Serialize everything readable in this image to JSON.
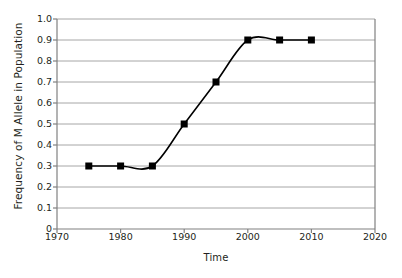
{
  "chart_data": {
    "type": "line",
    "title": "",
    "xlabel": "Time",
    "ylabel": "Frequency of M Allele in Population",
    "x": [
      1975,
      1980,
      1985,
      1990,
      1995,
      2000,
      2005,
      2010
    ],
    "values": [
      0.3,
      0.3,
      0.3,
      0.5,
      0.7,
      0.9,
      0.9,
      0.9
    ],
    "series": [
      {
        "name": "M allele frequency",
        "values": [
          0.3,
          0.3,
          0.3,
          0.5,
          0.7,
          0.9,
          0.9,
          0.9
        ]
      }
    ],
    "xlim": [
      1970,
      2020
    ],
    "ylim": [
      0,
      1.0
    ],
    "xticks": [
      1970,
      1980,
      1990,
      2000,
      2010,
      2020
    ],
    "xtick_labels": [
      "1970",
      "1980",
      "1990",
      "2000",
      "2010",
      "2020"
    ],
    "yticks": [
      0,
      0.1,
      0.2,
      0.3,
      0.4,
      0.5,
      0.6,
      0.7,
      0.8,
      0.9,
      1.0
    ],
    "ytick_labels": [
      "0",
      "0.1",
      "0.2",
      "0.3",
      "0.4",
      "0.5",
      "0.6",
      "0.7",
      "0.8",
      "0.9",
      "1.0"
    ],
    "grid": "horizontal",
    "legend": "none",
    "marker": "square",
    "line_style": "smooth",
    "colors": {
      "line": "#000000",
      "marker": "#000000",
      "grid": "#a6a6a6",
      "axis": "#808080",
      "text": "#231f20",
      "background": "#ffffff"
    }
  }
}
